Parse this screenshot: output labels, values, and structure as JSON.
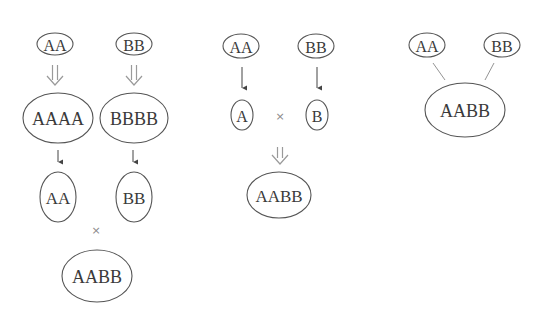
{
  "diagram": {
    "colors": {
      "stroke": "#555555",
      "text": "#3a3a3a",
      "double_arrow": "#9a9a9a",
      "cross": "#8a8a8a"
    },
    "left": {
      "top_a": "AA",
      "top_b": "BB",
      "mid_a": "AAAA",
      "mid_b": "BBBB",
      "low_a": "AA",
      "low_b": "BB",
      "cross": "×",
      "result": "AABB"
    },
    "middle": {
      "top_a": "AA",
      "top_b": "BB",
      "gamete_a": "A",
      "gamete_b": "B",
      "cross": "×",
      "result": "AABB"
    },
    "right": {
      "top_a": "AA",
      "top_b": "BB",
      "result": "AABB"
    }
  }
}
